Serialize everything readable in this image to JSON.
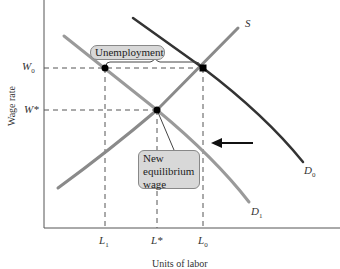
{
  "diagram": {
    "axes": {
      "y_label": "Wage rate",
      "x_label": "Units of labor",
      "y_ticks": [
        {
          "id": "W0",
          "base": "W",
          "sub": "0"
        },
        {
          "id": "Wstar",
          "base": "W*",
          "sub": ""
        }
      ],
      "x_ticks": [
        {
          "id": "L1",
          "base": "L",
          "sub": "1"
        },
        {
          "id": "Lstar",
          "base": "L*",
          "sub": ""
        },
        {
          "id": "L0",
          "base": "L",
          "sub": "0"
        }
      ]
    },
    "curves": {
      "supply": {
        "label": "S",
        "color": "#888888"
      },
      "demand_original": {
        "label_base": "D",
        "label_sub": "0",
        "color": "#333333"
      },
      "demand_new": {
        "label_base": "D",
        "label_sub": "1",
        "color": "#999999"
      }
    },
    "callouts": {
      "unemployment": "Unemployment",
      "new_equilibrium_line1": "New",
      "new_equilibrium_line2": "equilibrium",
      "new_equilibrium_line3": "wage"
    },
    "arrow": {
      "direction": "left",
      "meaning": "demand shifts left"
    },
    "colors": {
      "axis": "#555555",
      "dashed": "#555555",
      "callout_fill": "#d8d8d8",
      "point": "#000000"
    }
  }
}
